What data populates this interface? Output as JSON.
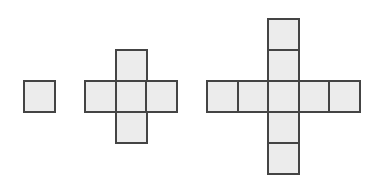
{
  "diagram": {
    "colors": {
      "fill": "#ececec",
      "stroke": "#444444",
      "background": "#ffffff"
    },
    "cell_size": 31,
    "figures": [
      {
        "name": "figure-1",
        "tile_count": 1,
        "cells": [
          {
            "x": 23,
            "y": 80
          }
        ]
      },
      {
        "name": "figure-2",
        "tile_count": 5,
        "cells": [
          {
            "x": 115,
            "y": 49
          },
          {
            "x": 84,
            "y": 80
          },
          {
            "x": 115,
            "y": 80
          },
          {
            "x": 145,
            "y": 80
          },
          {
            "x": 115,
            "y": 111
          }
        ]
      },
      {
        "name": "figure-3",
        "tile_count": 9,
        "cells": [
          {
            "x": 267,
            "y": 18
          },
          {
            "x": 267,
            "y": 49
          },
          {
            "x": 206,
            "y": 80
          },
          {
            "x": 237,
            "y": 80
          },
          {
            "x": 267,
            "y": 80
          },
          {
            "x": 298,
            "y": 80
          },
          {
            "x": 328,
            "y": 80
          },
          {
            "x": 267,
            "y": 111
          },
          {
            "x": 267,
            "y": 142
          }
        ]
      }
    ]
  }
}
